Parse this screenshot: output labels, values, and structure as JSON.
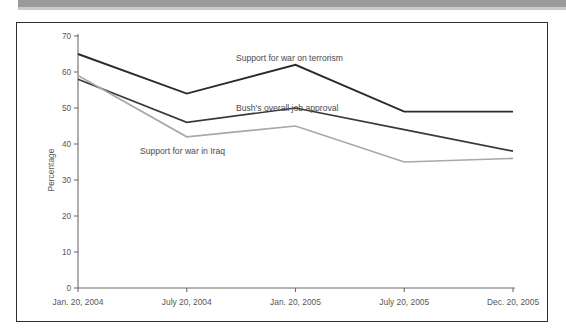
{
  "figure": {
    "frame_border_color": "#2f2f2f",
    "background": "#ffffff",
    "header_strip_color": "#9a9a9a"
  },
  "chart_data": {
    "type": "line",
    "title": "",
    "subtitle": "",
    "xlabel": "",
    "ylabel": "Percentage",
    "ylim": [
      0,
      70
    ],
    "ytick_values": [
      0,
      10,
      20,
      30,
      40,
      50,
      60,
      70
    ],
    "ytick_labels": [
      "0",
      "10",
      "20",
      "30",
      "40",
      "50",
      "60",
      "70"
    ],
    "grid": false,
    "legend_position": "inline-annotations",
    "categories": [
      "Jan. 20, 2004",
      "July 20, 2004",
      "Jan. 20, 2005",
      "July 20, 2005",
      "Dec. 20, 2005"
    ],
    "series": [
      {
        "name": "Support for war on terrorism",
        "color": "#2b2b2b",
        "stroke_width": 1.9,
        "values": [
          65,
          54,
          62,
          49,
          49
        ],
        "annotation": {
          "text": "Support for war on terrorism",
          "x": 236,
          "y": 61
        }
      },
      {
        "name": "Bush's overall job approval",
        "color": "#3a3a3a",
        "stroke_width": 1.7,
        "values": [
          58,
          46,
          50,
          44,
          38
        ],
        "annotation": {
          "text": "Bush's overall job approval",
          "x": 236,
          "y": 111
        }
      },
      {
        "name": "Support for war in Iraq",
        "color": "#a8a8a8",
        "stroke_width": 1.7,
        "values": [
          59,
          42,
          45,
          35,
          36
        ],
        "annotation": {
          "text": "Support for war in Iraq",
          "x": 140,
          "y": 154
        }
      }
    ]
  }
}
